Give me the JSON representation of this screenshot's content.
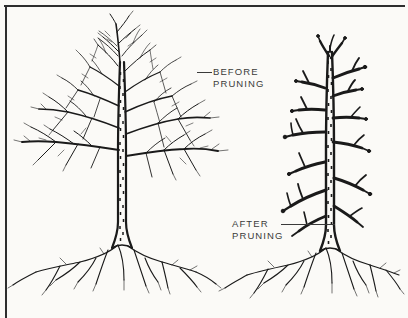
{
  "figure": {
    "background_color": "#fbfaf7",
    "ink_color": "#1a1a1a",
    "text_color": "#3a3a3a",
    "border_color": "#2e2e2e",
    "width": 408,
    "height": 318
  },
  "labels": {
    "before": {
      "line1": "BEFORE",
      "line2": "PRUNING",
      "full_text": "BEFORE PRUNING"
    },
    "after": {
      "line1": "AFTER",
      "line2": "PRUNING",
      "full_text": "AFTER PRUNING"
    }
  },
  "illustrations": [
    {
      "name": "before-pruning-tree",
      "description": "Unpruned deciduous tree with dense crown of long spreading lateral branches and fine twigs, mottled trunk, spreading root system",
      "state": "unpruned"
    },
    {
      "name": "after-pruning-tree",
      "description": "Pruned deciduous tree reduced to central leader with short blunt-cut branch stubs, mottled trunk, spreading root system",
      "state": "pruned"
    }
  ]
}
